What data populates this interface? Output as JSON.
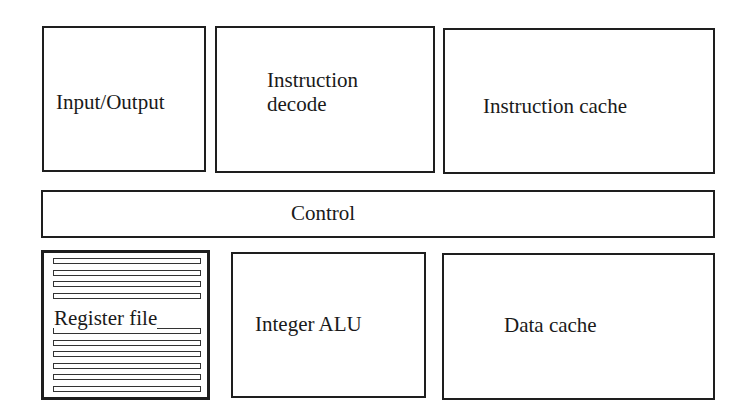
{
  "diagram": {
    "type": "processor-block-diagram",
    "top_row": [
      {
        "id": "io",
        "label": "Input/Output"
      },
      {
        "id": "instruction-decode",
        "label": "Instruction\ndecode"
      },
      {
        "id": "instruction-cache",
        "label": "Instruction cache"
      }
    ],
    "control": {
      "label": "Control"
    },
    "bottom_row": [
      {
        "id": "register-file",
        "label": "Register file",
        "rows_above_label": 4,
        "rows_below_label": 6
      },
      {
        "id": "integer-alu",
        "label": "Integer ALU"
      },
      {
        "id": "data-cache",
        "label": "Data cache"
      }
    ]
  }
}
